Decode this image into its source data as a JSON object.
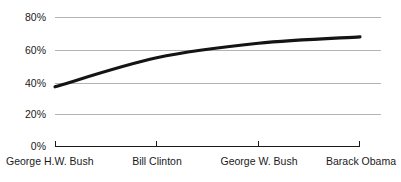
{
  "chart_data": {
    "type": "line",
    "title": "",
    "subtitle": "",
    "xlabel": "",
    "ylabel": "",
    "categories": [
      "George H.W. Bush",
      "Bill Clinton",
      "George W. Bush",
      "Barack Obama"
    ],
    "values": [
      37,
      55,
      64,
      68
    ],
    "series": [
      {
        "name": "",
        "values": [
          37,
          55,
          64,
          68
        ]
      }
    ],
    "ylim": [
      0,
      80
    ],
    "yticks": [
      0,
      20,
      40,
      60,
      80
    ],
    "ytick_labels": [
      "0%",
      "20%",
      "40%",
      "60%",
      "80%"
    ],
    "xtick_labels": [
      "George H.W. Bush",
      "Bill Clinton",
      "George W. Bush",
      "Barack Obama"
    ],
    "grid": true,
    "grid_axis": "y",
    "legend": false,
    "legend_position": "none",
    "annotations": [],
    "colors": {
      "line": "#141414",
      "gridline": "#b3b3b3",
      "axis": "#1a1a1a",
      "text": "#1a1a1a",
      "background": "#ffffff"
    }
  },
  "axis": {
    "y": {
      "ticks": [
        {
          "label": "80%",
          "value": 80
        },
        {
          "label": "60%",
          "value": 60
        },
        {
          "label": "40%",
          "value": 40
        },
        {
          "label": "20%",
          "value": 20
        },
        {
          "label": "0%",
          "value": 0
        }
      ]
    },
    "x": {
      "ticks": [
        {
          "label": "George H.W. Bush",
          "value": 0
        },
        {
          "label": "Bill Clinton",
          "value": 1
        },
        {
          "label": "George W. Bush",
          "value": 2
        },
        {
          "label": "Barack Obama",
          "value": 3
        }
      ]
    }
  }
}
